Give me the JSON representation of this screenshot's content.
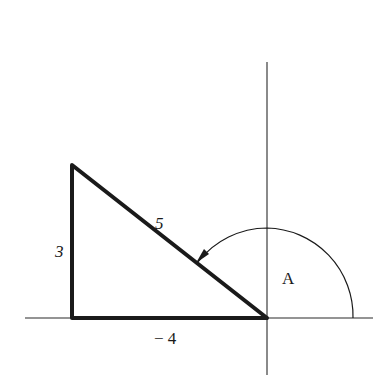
{
  "diagram": {
    "type": "triangle-angle-in-standard-position",
    "colors": {
      "line": "#1a1a1a",
      "axis": "#2a2a2a",
      "background": "#ffffff"
    },
    "axes": {
      "origin": [
        267,
        318
      ],
      "x_axis": {
        "from": [
          25,
          318
        ],
        "to": [
          373,
          318
        ]
      },
      "y_axis": {
        "from": [
          267,
          62
        ],
        "to": [
          267,
          375
        ]
      }
    },
    "triangle": {
      "vertices": [
        [
          72,
          165
        ],
        [
          72,
          318
        ],
        [
          267,
          318
        ]
      ],
      "sides": [
        {
          "name": "vertical-leg",
          "label": "3"
        },
        {
          "name": "horizontal-leg",
          "label": "− 4"
        },
        {
          "name": "hypotenuse",
          "label": "5"
        }
      ]
    },
    "angle": {
      "label": "A",
      "arc_radius": 88,
      "from_deg": 0,
      "to_deg": 143.13,
      "direction": "counterclockwise",
      "arrowhead": "at-hypotenuse"
    }
  },
  "labels": {
    "side_a": "3",
    "side_b": "− 4",
    "side_c": "5",
    "angle": "A"
  }
}
